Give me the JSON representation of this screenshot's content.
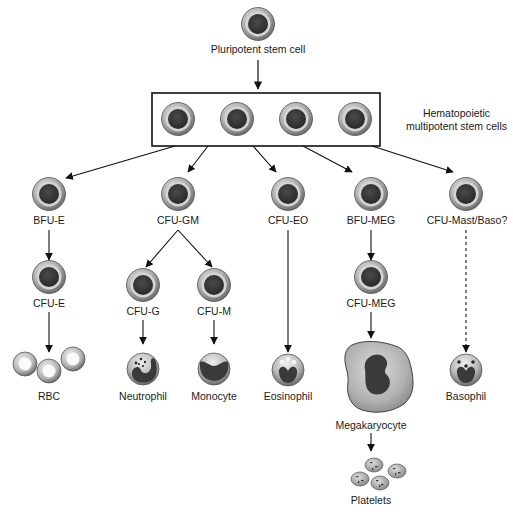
{
  "diagram": {
    "colors": {
      "line": "#111111",
      "cell_outer": "#a8a8a8",
      "cell_ring": "#d8d8d8",
      "nucleus": "#3a3a3a",
      "box_border": "#111111"
    },
    "nodes": {
      "pluripotent": {
        "label": "Pluripotent stem cell"
      },
      "multipotent": {
        "label_line1": "Hematopoietic",
        "label_line2": "multipotent stem cells",
        "cell_count": 4
      },
      "bfu_e": {
        "label": "BFU-E"
      },
      "cfu_gm": {
        "label": "CFU-GM"
      },
      "cfu_eo": {
        "label": "CFU-EO"
      },
      "bfu_meg": {
        "label": "BFU-MEG"
      },
      "cfu_mast_baso": {
        "label": "CFU-Mast/Baso?"
      },
      "cfu_e": {
        "label": "CFU-E"
      },
      "cfu_g": {
        "label": "CFU-G"
      },
      "cfu_m": {
        "label": "CFU-M"
      },
      "cfu_meg": {
        "label": "CFU-MEG"
      },
      "rbc": {
        "label": "RBC"
      },
      "neutrophil": {
        "label": "Neutrophil"
      },
      "monocyte": {
        "label": "Monocyte"
      },
      "eosinophil": {
        "label": "Eosinophil"
      },
      "megakaryocyte": {
        "label": "Megakaryocyte"
      },
      "basophil": {
        "label": "Basophil"
      },
      "platelets": {
        "label": "Platelets"
      }
    },
    "edges": [
      {
        "from": "pluripotent",
        "to": "multipotent",
        "style": "solid"
      },
      {
        "from": "multipotent",
        "to": "bfu_e",
        "style": "solid"
      },
      {
        "from": "multipotent",
        "to": "cfu_gm",
        "style": "solid"
      },
      {
        "from": "multipotent",
        "to": "cfu_eo",
        "style": "solid"
      },
      {
        "from": "multipotent",
        "to": "bfu_meg",
        "style": "solid"
      },
      {
        "from": "multipotent",
        "to": "cfu_mast_baso",
        "style": "solid"
      },
      {
        "from": "bfu_e",
        "to": "cfu_e",
        "style": "solid"
      },
      {
        "from": "cfu_gm",
        "to": "cfu_g",
        "style": "solid"
      },
      {
        "from": "cfu_gm",
        "to": "cfu_m",
        "style": "solid"
      },
      {
        "from": "bfu_meg",
        "to": "cfu_meg",
        "style": "solid"
      },
      {
        "from": "cfu_e",
        "to": "rbc",
        "style": "solid"
      },
      {
        "from": "cfu_g",
        "to": "neutrophil",
        "style": "solid"
      },
      {
        "from": "cfu_m",
        "to": "monocyte",
        "style": "solid"
      },
      {
        "from": "cfu_eo",
        "to": "eosinophil",
        "style": "solid"
      },
      {
        "from": "cfu_meg",
        "to": "megakaryocyte",
        "style": "solid"
      },
      {
        "from": "cfu_mast_baso",
        "to": "basophil",
        "style": "dashed"
      },
      {
        "from": "megakaryocyte",
        "to": "platelets",
        "style": "solid"
      }
    ]
  }
}
